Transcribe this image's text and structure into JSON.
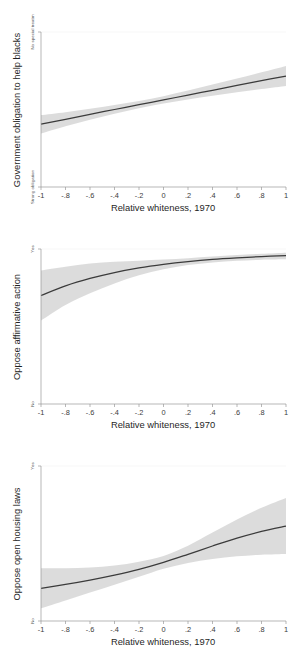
{
  "figure": {
    "background_color": "#ffffff",
    "line_color": "#3b3b3b",
    "band_color": "#d9d9d9",
    "axis_color": "#9a9a9a",
    "panel_count": 3
  },
  "chart_data": [
    {
      "type": "line",
      "title": "",
      "xlabel": "Relative whiteness, 1970",
      "ylabel": "Government obligation to help blacks",
      "xlim": [
        -1,
        1
      ],
      "ylim": [
        0,
        1
      ],
      "xticks": [
        -1,
        -0.8,
        -0.6,
        -0.4,
        -0.2,
        0,
        0.2,
        0.4,
        0.6,
        0.8,
        1
      ],
      "xticklabels": [
        "-1",
        "-.8",
        "-.6",
        "-.4",
        "-.2",
        "0",
        ".2",
        ".4",
        ".6",
        ".8",
        "1"
      ],
      "yticks": [
        0,
        1
      ],
      "yticklabels": [
        "Strong obligation",
        "No special treatm"
      ],
      "grid": false,
      "legend": "none",
      "series": [
        {
          "name": "Predicted government obligation",
          "x": [
            -1,
            -0.8,
            -0.6,
            -0.4,
            -0.2,
            0,
            0.2,
            0.4,
            0.6,
            0.8,
            1
          ],
          "values": [
            0.405,
            0.437,
            0.469,
            0.5,
            0.531,
            0.562,
            0.593,
            0.624,
            0.655,
            0.686,
            0.716
          ],
          "ci_lower": [
            0.345,
            0.392,
            0.434,
            0.472,
            0.508,
            0.538,
            0.564,
            0.588,
            0.611,
            0.632,
            0.652
          ],
          "ci_upper": [
            0.464,
            0.483,
            0.505,
            0.529,
            0.555,
            0.586,
            0.622,
            0.661,
            0.7,
            0.74,
            0.781
          ]
        }
      ]
    },
    {
      "type": "line",
      "title": "",
      "xlabel": "Relative whiteness, 1970",
      "ylabel": "Oppose affirmative action",
      "xlim": [
        -1,
        1
      ],
      "ylim": [
        0,
        1
      ],
      "xticks": [
        -1,
        -0.8,
        -0.6,
        -0.4,
        -0.2,
        0,
        0.2,
        0.4,
        0.6,
        0.8,
        1
      ],
      "xticklabels": [
        "-1",
        "-.8",
        "-.6",
        "-.4",
        "-.2",
        "0",
        ".2",
        ".4",
        ".6",
        ".8",
        "1"
      ],
      "yticks": [
        0,
        1
      ],
      "yticklabels": [
        "No",
        "Yes"
      ],
      "grid": false,
      "legend": "none",
      "series": [
        {
          "name": "Predicted opposition to affirmative action",
          "x": [
            -1,
            -0.8,
            -0.6,
            -0.4,
            -0.2,
            0,
            0.2,
            0.4,
            0.6,
            0.8,
            1
          ],
          "values": [
            0.7,
            0.762,
            0.81,
            0.848,
            0.878,
            0.901,
            0.919,
            0.933,
            0.943,
            0.951,
            0.957
          ],
          "ci_lower": [
            0.538,
            0.638,
            0.714,
            0.778,
            0.83,
            0.869,
            0.896,
            0.913,
            0.924,
            0.931,
            0.934
          ],
          "ci_upper": [
            0.862,
            0.886,
            0.906,
            0.918,
            0.925,
            0.932,
            0.941,
            0.952,
            0.962,
            0.969,
            0.976
          ]
        }
      ]
    },
    {
      "type": "line",
      "title": "",
      "xlabel": "Relative whiteness, 1970",
      "ylabel": "Oppose open housing laws",
      "xlim": [
        -1,
        1
      ],
      "ylim": [
        0,
        1
      ],
      "xticks": [
        -1,
        -0.8,
        -0.6,
        -0.4,
        -0.2,
        0,
        0.2,
        0.4,
        0.6,
        0.8,
        1
      ],
      "xticklabels": [
        "-1",
        "-.8",
        "-.6",
        "-.4",
        "-.2",
        "0",
        ".2",
        ".4",
        ".6",
        ".8",
        "1"
      ],
      "yticks": [
        0,
        1
      ],
      "yticklabels": [
        "No",
        "Yes"
      ],
      "grid": false,
      "legend": "none",
      "series": [
        {
          "name": "Predicted opposition to open housing laws",
          "x": [
            -1,
            -0.8,
            -0.6,
            -0.4,
            -0.2,
            0,
            0.2,
            0.4,
            0.6,
            0.8,
            1
          ],
          "values": [
            0.211,
            0.236,
            0.264,
            0.296,
            0.333,
            0.378,
            0.43,
            0.484,
            0.535,
            0.578,
            0.612
          ],
          "ci_lower": [
            0.082,
            0.133,
            0.184,
            0.234,
            0.285,
            0.337,
            0.375,
            0.4,
            0.417,
            0.428,
            0.433
          ],
          "ci_upper": [
            0.341,
            0.34,
            0.345,
            0.358,
            0.383,
            0.42,
            0.486,
            0.571,
            0.655,
            0.73,
            0.793
          ]
        }
      ]
    }
  ]
}
